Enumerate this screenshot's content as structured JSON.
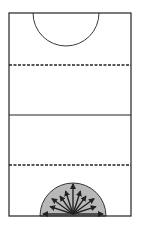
{
  "diagram": {
    "type": "court-layout",
    "background": "#ffffff",
    "line_color": "#222222",
    "shade_color": "#b8b8b8",
    "court": {
      "x": 9,
      "y": 13,
      "width": 122,
      "height": 203
    },
    "top_circle": {
      "cx": 66,
      "cy": 13,
      "r": 33,
      "shaded": false
    },
    "bottom_circle": {
      "cx": 73,
      "cy": 216,
      "r": 33,
      "shaded": true
    },
    "lines": [
      {
        "name": "upper-third-line",
        "y": 65,
        "style": "dashed"
      },
      {
        "name": "center-line",
        "y": 115,
        "style": "solid"
      },
      {
        "name": "lower-third-line",
        "y": 165,
        "style": "dashed"
      }
    ],
    "arrows": {
      "origin": {
        "x": 73,
        "y": 214
      },
      "count": 11,
      "angles_deg": [
        0,
        18,
        36,
        54,
        72,
        90,
        108,
        126,
        144,
        162,
        180
      ],
      "lengths": [
        30,
        24,
        26,
        22,
        24,
        30,
        24,
        22,
        26,
        24,
        30
      ]
    }
  }
}
